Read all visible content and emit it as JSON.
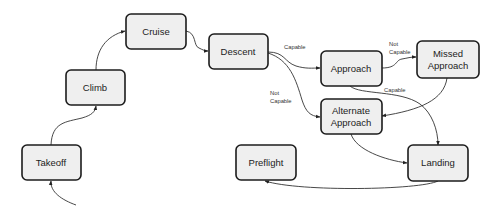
{
  "diagram": {
    "nodes": {
      "cruise": {
        "label": "Cruise"
      },
      "climb": {
        "label": "Climb"
      },
      "descent": {
        "label": "Descent"
      },
      "approach": {
        "label": "Approach"
      },
      "missed_approach": {
        "line1": "Missed",
        "line2": "Approach"
      },
      "alternate_approach": {
        "line1": "Alternate",
        "line2": "Approach"
      },
      "takeoff": {
        "label": "Takeoff"
      },
      "preflight": {
        "label": "Preflight"
      },
      "landing": {
        "label": "Landing"
      }
    },
    "edge_labels": {
      "descent_to_approach": "Capable",
      "descent_to_alternate_line1": "Not",
      "descent_to_alternate_line2": "Capable",
      "approach_to_missed_line1": "Not",
      "approach_to_missed_line2": "Capable",
      "approach_to_landing": "Capable"
    },
    "edges": [
      {
        "from": "start",
        "to": "takeoff"
      },
      {
        "from": "takeoff",
        "to": "climb"
      },
      {
        "from": "climb",
        "to": "cruise"
      },
      {
        "from": "cruise",
        "to": "descent"
      },
      {
        "from": "descent",
        "to": "approach",
        "label": "Capable"
      },
      {
        "from": "descent",
        "to": "alternate_approach",
        "label": "Not Capable"
      },
      {
        "from": "approach",
        "to": "missed_approach",
        "label": "Not Capable"
      },
      {
        "from": "approach",
        "to": "landing",
        "label": "Capable"
      },
      {
        "from": "missed_approach",
        "to": "alternate_approach"
      },
      {
        "from": "alternate_approach",
        "to": "landing"
      },
      {
        "from": "landing",
        "to": "preflight"
      }
    ]
  }
}
